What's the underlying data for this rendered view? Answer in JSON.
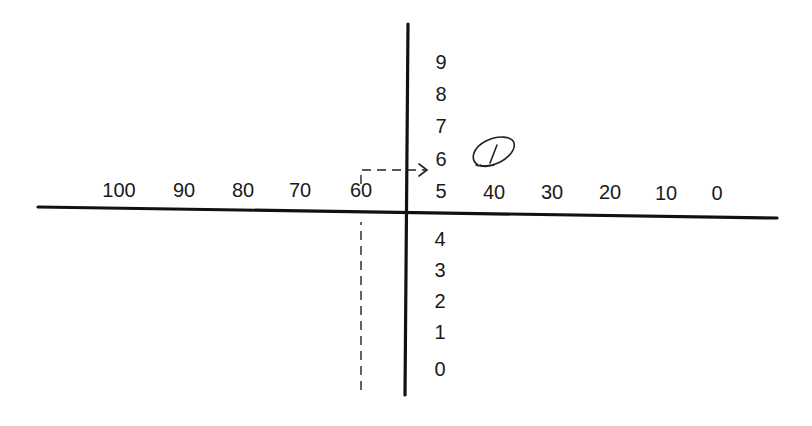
{
  "diagram": {
    "horizontal_scale": {
      "labels": [
        "100",
        "90",
        "80",
        "70",
        "60",
        "40",
        "30",
        "20",
        "10",
        "0"
      ],
      "values": [
        100,
        90,
        80,
        70,
        60,
        40,
        30,
        20,
        10,
        0
      ],
      "direction": "decreasing left-to-right"
    },
    "vertical_scale": {
      "labels_above": [
        "9",
        "8",
        "7",
        "6",
        "5"
      ],
      "labels_below": [
        "4",
        "3",
        "2",
        "1",
        "0"
      ]
    },
    "reading": {
      "from_horizontal_value": 60,
      "to_vertical_value": 6,
      "annotation": "1",
      "annotation_style": "handwritten circled"
    }
  }
}
